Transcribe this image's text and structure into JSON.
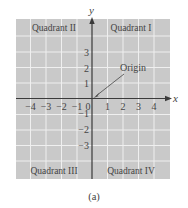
{
  "figure": {
    "caption": "(a)",
    "axes": {
      "x_label": "x",
      "y_label": "y",
      "x_ticks": [
        "−4",
        "−3",
        "−2",
        "−1",
        "0",
        "1",
        "2",
        "3",
        "4"
      ],
      "y_ticks_positive": [
        "1",
        "2",
        "3"
      ],
      "y_ticks_negative": [
        "−1",
        "−2",
        "−3"
      ]
    },
    "quadrants": {
      "q1": "Quadrant I",
      "q2": "Quadrant II",
      "q3": "Quadrant III",
      "q4": "Quadrant IV"
    },
    "annotation": {
      "origin_label": "Origin"
    },
    "colors": {
      "grid_fill": "#c9c9c9",
      "grid_lines": "#f2f2f2",
      "axis": "#3a3a3a",
      "text": "#444444"
    }
  }
}
